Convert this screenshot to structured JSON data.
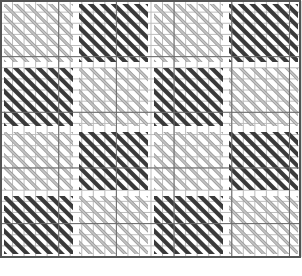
{
  "pattern": {
    "grid_columns": 26,
    "grid_rows": 23,
    "block_columns": 4,
    "block_rows": 4,
    "blocks": [
      [
        "light",
        "dark",
        "light",
        "dark"
      ],
      [
        "dark",
        "light",
        "dark",
        "light"
      ],
      [
        "light",
        "dark",
        "light",
        "dark"
      ],
      [
        "dark",
        "light",
        "dark",
        "light"
      ]
    ],
    "stitch_direction": "diagonal-down-right"
  },
  "colors": {
    "background": "#ffffff",
    "grid_line": "#bdbdbd",
    "major_grid_line": "#6b6b6b",
    "border": "#555555",
    "dark_stitch": "#3a3a3a",
    "light_stitch": "#c4c4c4",
    "light_stitch_outline": "#9a9a9a"
  }
}
